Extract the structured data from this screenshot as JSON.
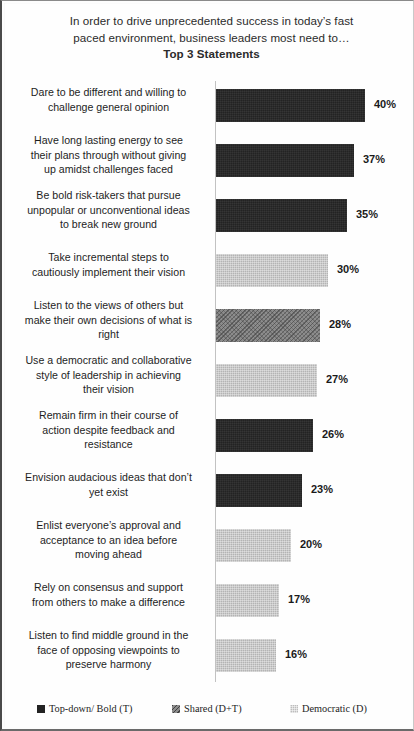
{
  "title": {
    "line1": "In order to drive unprecedented success in today’s fast",
    "line2": "paced environment, business leaders most need to…",
    "line3": "Top 3 Statements"
  },
  "legend": {
    "items": [
      {
        "key": "t",
        "label": "Top-down/ Bold (T)",
        "color": "#232323"
      },
      {
        "key": "dt",
        "label": "Shared (D+T)",
        "color": "#8c8c8c"
      },
      {
        "key": "d",
        "label": "Democratic (D)",
        "color": "#b4b4b4"
      }
    ]
  },
  "chart_data": {
    "type": "bar",
    "orientation": "horizontal",
    "title": "In order to drive unprecedented success in today’s fast paced environment, business leaders most need to… Top 3 Statements",
    "xlabel": "",
    "ylabel": "",
    "xlim": [
      0,
      45
    ],
    "grid": false,
    "legend_position": "bottom",
    "value_format": "{v}%",
    "series_keys": [
      "Top-down/ Bold (T)",
      "Shared (D+T)",
      "Democratic (D)"
    ],
    "categories": [
      "Dare to be different and willing to challenge  general opinion",
      "Have long lasting energy to see their plans through without giving up amidst challenges faced",
      "Be bold risk-takers  that pursue unpopular or unconventional ideas to break new ground",
      "Take incremental steps to cautiously implement their vision",
      "Listen to the views of others but make their own decisions of what is right",
      "Use a democratic and collaborative style of leadership  in achieving their vision",
      "Remain firm in their course of action despite feedback and resistance",
      "Envision audacious ideas that don’t yet exist",
      "Enlist everyone’s approval and acceptance to an idea before moving ahead",
      "Rely on consensus and support from others to make a difference",
      "Listen to find middle ground in the face of opposing viewpoints  to preserve harmony"
    ],
    "values": [
      40,
      37,
      35,
      30,
      28,
      27,
      26,
      23,
      20,
      17,
      16
    ],
    "group": [
      "t",
      "t",
      "t",
      "d",
      "dt",
      "d",
      "t",
      "t",
      "d",
      "d",
      "d"
    ]
  },
  "bars": [
    {
      "value_label": "40%",
      "value": 40,
      "group": "t",
      "lines": 2,
      "l1": "Dare to be different and willing to",
      "l2": "challenge  general opinion",
      "l3": ""
    },
    {
      "value_label": "37%",
      "value": 37,
      "group": "t",
      "lines": 3,
      "l1": "Have long lasting energy to see",
      "l2": "their plans through without giving",
      "l3": "up amidst challenges faced"
    },
    {
      "value_label": "35%",
      "value": 35,
      "group": "t",
      "lines": 3,
      "l1": "Be bold risk-takers  that pursue",
      "l2": "unpopular or unconventional ideas",
      "l3": "to break new ground"
    },
    {
      "value_label": "30%",
      "value": 30,
      "group": "d",
      "lines": 2,
      "l1": "Take incremental steps to",
      "l2": "cautiously implement their vision",
      "l3": ""
    },
    {
      "value_label": "28%",
      "value": 28,
      "group": "dt",
      "lines": 3,
      "l1": "Listen to the views of others but",
      "l2": "make their own decisions of what is",
      "l3": "right"
    },
    {
      "value_label": "27%",
      "value": 27,
      "group": "d",
      "lines": 3,
      "l1": "Use a democratic and collaborative",
      "l2": "style of leadership  in achieving",
      "l3": "their vision"
    },
    {
      "value_label": "26%",
      "value": 26,
      "group": "t",
      "lines": 3,
      "l1": "Remain firm in their course of",
      "l2": "action despite feedback and",
      "l3": "resistance"
    },
    {
      "value_label": "23%",
      "value": 23,
      "group": "t",
      "lines": 2,
      "l1": "Envision audacious ideas that don’t",
      "l2": "yet exist",
      "l3": ""
    },
    {
      "value_label": "20%",
      "value": 20,
      "group": "d",
      "lines": 3,
      "l1": "Enlist everyone’s approval and",
      "l2": "acceptance to an idea before",
      "l3": "moving ahead"
    },
    {
      "value_label": "17%",
      "value": 17,
      "group": "d",
      "lines": 2,
      "l1": "Rely on consensus and support",
      "l2": "from others to make a difference",
      "l3": ""
    },
    {
      "value_label": "16%",
      "value": 16,
      "group": "d",
      "lines": 3,
      "l1": "Listen to find middle ground in the",
      "l2": "face of opposing viewpoints  to",
      "l3": "preserve harmony"
    }
  ]
}
